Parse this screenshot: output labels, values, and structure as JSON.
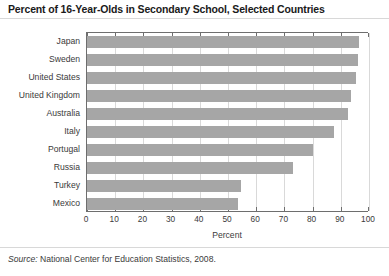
{
  "chart_data": {
    "type": "bar",
    "orientation": "horizontal",
    "title": "Percent of 16-Year-Olds in Secondary School, Selected Countries",
    "xlabel": "Percent",
    "ylabel": "",
    "xlim": [
      0,
      100
    ],
    "xticks": [
      0,
      10,
      20,
      30,
      40,
      50,
      60,
      70,
      80,
      90,
      100
    ],
    "grid": true,
    "legend": false,
    "bar_color": "#a6a6a6",
    "categories": [
      "Japan",
      "Sweden",
      "United States",
      "United Kingdom",
      "Australia",
      "Italy",
      "Portugal",
      "Russia",
      "Turkey",
      "Mexico"
    ],
    "values": [
      96.5,
      96,
      95.5,
      93.5,
      92.5,
      87.5,
      80,
      73,
      54.5,
      53.5
    ]
  },
  "source": {
    "label": "Source:",
    "text": "National Center for Education Statistics, 2008."
  }
}
